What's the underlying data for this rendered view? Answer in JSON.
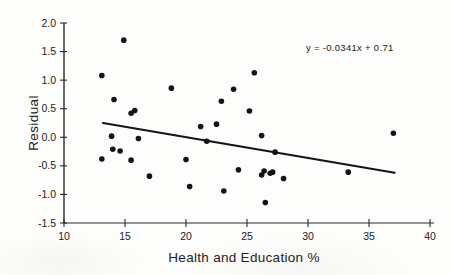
{
  "figure": {
    "background": "#fdfdfc",
    "ink_color": "#1b1b1b",
    "dot_color": "#141414",
    "axis_color": "#2a2a2a"
  },
  "chart_data": {
    "type": "scatter",
    "title": "",
    "xlabel": "Health and Education %",
    "ylabel": "Residual",
    "xlim": [
      10,
      40
    ],
    "ylim": [
      -1.5,
      2.0
    ],
    "x_ticks": [
      "10",
      "15",
      "20",
      "25",
      "30",
      "35",
      "40"
    ],
    "y_ticks": [
      "2.0",
      "1.5",
      "1.0",
      "0.5",
      "0.0",
      "-0.5",
      "-1.0",
      "-1.5"
    ],
    "grid": false,
    "legend": null,
    "annotation": "y = -0.0341x + 0.71",
    "points": [
      [
        14.9,
        1.7
      ],
      [
        13.1,
        1.08
      ],
      [
        14.1,
        0.66
      ],
      [
        18.8,
        0.86
      ],
      [
        15.5,
        0.42
      ],
      [
        15.8,
        0.47
      ],
      [
        21.2,
        0.19
      ],
      [
        22.5,
        0.23
      ],
      [
        22.9,
        0.63
      ],
      [
        23.9,
        0.84
      ],
      [
        25.6,
        1.13
      ],
      [
        25.2,
        0.46
      ],
      [
        26.2,
        0.03
      ],
      [
        13.9,
        0.02
      ],
      [
        16.1,
        -0.02
      ],
      [
        14.0,
        -0.21
      ],
      [
        14.6,
        -0.24
      ],
      [
        13.1,
        -0.38
      ],
      [
        15.5,
        -0.4
      ],
      [
        17.0,
        -0.68
      ],
      [
        20.0,
        -0.39
      ],
      [
        21.7,
        -0.07
      ],
      [
        20.3,
        -0.86
      ],
      [
        23.1,
        -0.94
      ],
      [
        24.3,
        -0.57
      ],
      [
        27.3,
        -0.26
      ],
      [
        26.4,
        -0.59
      ],
      [
        26.2,
        -0.66
      ],
      [
        26.9,
        -0.63
      ],
      [
        27.1,
        -0.61
      ],
      [
        28.0,
        -0.72
      ],
      [
        26.5,
        -1.14
      ],
      [
        33.3,
        -0.61
      ],
      [
        37.0,
        0.07
      ]
    ],
    "trendline": {
      "slope": -0.0341,
      "intercept": 0.71,
      "x_start": 13.2,
      "y_start": 0.25,
      "x_end": 37.1,
      "y_end": -0.62
    }
  }
}
